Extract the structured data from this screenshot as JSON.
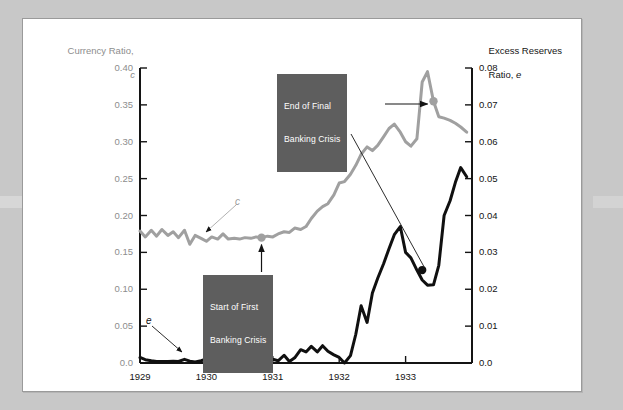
{
  "figure": {
    "background_color": "#c8c8c8",
    "panel_color": "#ffffff"
  },
  "chart_data": {
    "type": "line",
    "title": "",
    "subtitle": "",
    "xlabel": "",
    "ylabel": "Currency Ratio, c",
    "y2label": "Excess Reserves Ratio, e",
    "grid": false,
    "legend_position": "inline-labels",
    "xlim": [
      1929.0,
      1934.0
    ],
    "xticks": [
      "1929",
      "1930",
      "1931",
      "1932",
      "1933"
    ],
    "xtick_values": [
      1929,
      1930,
      1931,
      1932,
      1933
    ],
    "ylim": [
      0.0,
      0.4
    ],
    "yticks": [
      "0.0",
      "0.05",
      "0.10",
      "0.15",
      "0.20",
      "0.25",
      "0.30",
      "0.35",
      "0.40"
    ],
    "ytick_values": [
      0.0,
      0.05,
      0.1,
      0.15,
      0.2,
      0.25,
      0.3,
      0.35,
      0.4
    ],
    "y2lim": [
      0.0,
      0.08
    ],
    "y2ticks": [
      "0.0",
      "0.01",
      "0.02",
      "0.03",
      "0.04",
      "0.05",
      "0.06",
      "0.07",
      "0.08"
    ],
    "y2tick_values": [
      0.0,
      0.01,
      0.02,
      0.03,
      0.04,
      0.05,
      0.06,
      0.07,
      0.08
    ],
    "series": [
      {
        "name": "c",
        "label": "Currency Ratio, c",
        "axis": "left",
        "color": "#a0a0a0",
        "width": 3.0,
        "x": [
          1929.0,
          1929.08,
          1929.17,
          1929.25,
          1929.33,
          1929.42,
          1929.5,
          1929.58,
          1929.67,
          1929.75,
          1929.83,
          1929.92,
          1930.0,
          1930.08,
          1930.17,
          1930.25,
          1930.33,
          1930.42,
          1930.5,
          1930.58,
          1930.67,
          1930.75,
          1930.83,
          1930.92,
          1931.0,
          1931.08,
          1931.17,
          1931.25,
          1931.33,
          1931.42,
          1931.5,
          1931.58,
          1931.67,
          1931.75,
          1931.83,
          1931.92,
          1932.0,
          1932.08,
          1932.17,
          1932.25,
          1932.33,
          1932.42,
          1932.5,
          1932.58,
          1932.67,
          1932.75,
          1932.83,
          1932.92,
          1933.0,
          1933.08,
          1933.17,
          1933.25,
          1933.33,
          1933.42,
          1933.5,
          1933.58,
          1933.67,
          1933.75,
          1933.83,
          1933.92
        ],
        "values": [
          0.179,
          0.171,
          0.18,
          0.172,
          0.181,
          0.173,
          0.178,
          0.17,
          0.18,
          0.161,
          0.173,
          0.169,
          0.165,
          0.171,
          0.168,
          0.175,
          0.168,
          0.169,
          0.168,
          0.17,
          0.169,
          0.171,
          0.17,
          0.172,
          0.171,
          0.175,
          0.178,
          0.177,
          0.183,
          0.181,
          0.185,
          0.196,
          0.206,
          0.212,
          0.216,
          0.228,
          0.244,
          0.246,
          0.256,
          0.268,
          0.283,
          0.293,
          0.288,
          0.295,
          0.307,
          0.318,
          0.324,
          0.313,
          0.3,
          0.294,
          0.304,
          0.381,
          0.395,
          0.355,
          0.334,
          0.332,
          0.329,
          0.325,
          0.32,
          0.313
        ]
      },
      {
        "name": "e",
        "label": "Excess Reserves Ratio, e",
        "axis": "right",
        "color": "#101010",
        "width": 3.0,
        "x": [
          1929.0,
          1929.08,
          1929.17,
          1929.25,
          1929.33,
          1929.42,
          1929.5,
          1929.58,
          1929.67,
          1929.75,
          1929.83,
          1929.92,
          1930.0,
          1930.08,
          1930.17,
          1930.25,
          1930.33,
          1930.42,
          1930.5,
          1930.58,
          1930.67,
          1930.75,
          1930.83,
          1930.92,
          1931.0,
          1931.08,
          1931.17,
          1931.25,
          1931.33,
          1931.42,
          1931.5,
          1931.58,
          1931.67,
          1931.75,
          1931.83,
          1931.92,
          1932.0,
          1932.08,
          1932.17,
          1932.25,
          1932.33,
          1932.42,
          1932.5,
          1932.58,
          1932.67,
          1932.75,
          1932.83,
          1932.92,
          1933.0,
          1933.08,
          1933.17,
          1933.25,
          1933.33,
          1933.42,
          1933.5,
          1933.58,
          1933.67,
          1933.75,
          1933.83,
          1933.92
        ],
        "values": [
          0.0015,
          0.0009,
          0.0006,
          0.0004,
          0.0004,
          0.0004,
          0.0005,
          0.0004,
          0.001,
          0.0005,
          0.0003,
          0.0006,
          0.0011,
          0.0003,
          0.0002,
          0.0,
          0.0003,
          0.0002,
          0.0004,
          0.0016,
          0.0009,
          0.0002,
          0.0005,
          0.0008,
          0.001,
          0.0006,
          0.0021,
          0.0004,
          0.0014,
          0.0036,
          0.003,
          0.0045,
          0.003,
          0.0047,
          0.0032,
          0.0022,
          0.0015,
          0.0,
          0.002,
          0.0078,
          0.0155,
          0.011,
          0.019,
          0.023,
          0.027,
          0.031,
          0.0348,
          0.037,
          0.03,
          0.0285,
          0.0252,
          0.0225,
          0.0211,
          0.0212,
          0.0265,
          0.04,
          0.044,
          0.049,
          0.053,
          0.0505
        ]
      }
    ],
    "markers": [
      {
        "name": "start-first-banking-crisis-c",
        "series": "c",
        "x": 1930.83,
        "value": 0.17,
        "color": "#a0a0a0"
      },
      {
        "name": "start-first-banking-crisis-e",
        "series": "e",
        "x": 1930.83,
        "value": 0.0005,
        "color": "#101010"
      },
      {
        "name": "end-final-banking-crisis-c",
        "series": "c",
        "x": 1933.42,
        "value": 0.355,
        "color": "#a0a0a0"
      },
      {
        "name": "end-final-banking-crisis-e",
        "series": "e",
        "x": 1933.25,
        "value": 0.0252,
        "color": "#101010"
      }
    ],
    "annotations": [
      {
        "name": "end-of-final-banking-crisis",
        "text": "End of Final\nBanking Crisis"
      },
      {
        "name": "start-of-first-banking-crisis",
        "text": "Start of First\nBanking Crisis"
      },
      {
        "name": "series-label-c",
        "text": "c"
      },
      {
        "name": "series-label-e",
        "text": "e"
      }
    ]
  },
  "axes": {
    "left": {
      "title_line1": "Currency Ratio,",
      "title_line2": "c",
      "color": "#8d8d8d",
      "ticks": [
        "0.40",
        "0.35",
        "0.30",
        "0.25",
        "0.20",
        "0.15",
        "0.10",
        "0.05",
        "0.0"
      ]
    },
    "right": {
      "title_line1": "Excess Reserves",
      "title_line2_prefix": "Ratio, ",
      "title_line2_italic": "e",
      "color": "#141414",
      "ticks": [
        "0.08",
        "0.07",
        "0.06",
        "0.05",
        "0.04",
        "0.03",
        "0.02",
        "0.01",
        "0.0"
      ]
    },
    "bottom": {
      "ticks": [
        "1929",
        "1930",
        "1931",
        "1932",
        "1933"
      ]
    }
  },
  "callouts": {
    "end_of_final": {
      "line1": "End of Final",
      "line2": "Banking Crisis",
      "bg": "#5e5e5e",
      "fg": "#ffffff"
    },
    "start_of_first": {
      "line1": "Start of First",
      "line2": "Banking Crisis",
      "bg": "#5e5e5e",
      "fg": "#ffffff"
    }
  },
  "series_glyphs": {
    "c": "c",
    "e": "e"
  }
}
